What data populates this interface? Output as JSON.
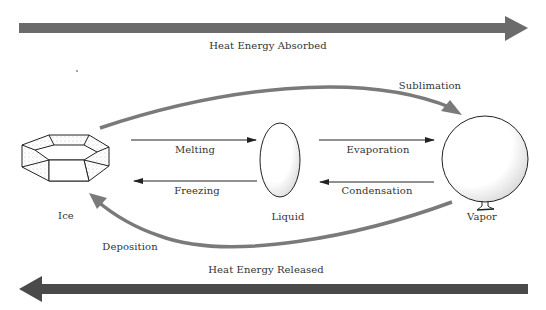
{
  "diagram": {
    "type": "phase-change diagram",
    "colors": {
      "heat_arrow": "#6b6b6b",
      "heat_arrow_dark": "#4a4a4a",
      "curve": "#7a7a7a",
      "line": "#222222"
    },
    "heat_absorbed": {
      "label": "Heat Energy Absorbed",
      "direction": "right"
    },
    "heat_released": {
      "label": "Heat Energy Released",
      "direction": "left"
    },
    "states": [
      {
        "id": "ice",
        "label": "Ice",
        "shape": "hexagonal-prism-icon"
      },
      {
        "id": "liquid",
        "label": "Liquid",
        "shape": "droplet-ellipse-icon"
      },
      {
        "id": "vapor",
        "label": "Vapor",
        "shape": "balloon-icon"
      }
    ],
    "transitions": [
      {
        "label": "Melting",
        "from": "ice",
        "to": "liquid"
      },
      {
        "label": "Freezing",
        "from": "liquid",
        "to": "ice"
      },
      {
        "label": "Evaporation",
        "from": "liquid",
        "to": "vapor"
      },
      {
        "label": "Condensation",
        "from": "vapor",
        "to": "liquid"
      },
      {
        "label": "Sublimation",
        "from": "ice",
        "to": "vapor"
      },
      {
        "label": "Deposition",
        "from": "vapor",
        "to": "ice"
      }
    ]
  }
}
